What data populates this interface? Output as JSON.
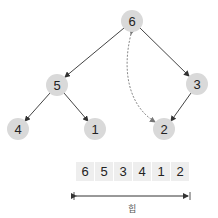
{
  "tree": {
    "nodes": [
      {
        "id": "n6",
        "label": "6",
        "cx": 132,
        "cy": 21
      },
      {
        "id": "n5",
        "label": "5",
        "cx": 57,
        "cy": 85
      },
      {
        "id": "n3",
        "label": "3",
        "cx": 197,
        "cy": 84
      },
      {
        "id": "n4",
        "label": "4",
        "cx": 18,
        "cy": 129
      },
      {
        "id": "n1",
        "label": "1",
        "cx": 95,
        "cy": 129
      },
      {
        "id": "n2",
        "label": "2",
        "cx": 164,
        "cy": 129
      }
    ],
    "edges": [
      {
        "from": "6",
        "to": "5"
      },
      {
        "from": "6",
        "to": "3"
      },
      {
        "from": "5",
        "to": "4"
      },
      {
        "from": "5",
        "to": "1"
      },
      {
        "from": "3",
        "to": "2"
      }
    ],
    "swap_arrow": {
      "between": [
        "6",
        "2"
      ],
      "style": "dashed",
      "bidirectional": true
    }
  },
  "array": {
    "cells": [
      "6",
      "5",
      "3",
      "4",
      "1",
      "2"
    ]
  },
  "span": {
    "label": "힙"
  },
  "colors": {
    "node_fill": "#d9d9d9",
    "cell_fill": "#eeeeee",
    "edge": "#444444",
    "dashed": "#888888"
  }
}
